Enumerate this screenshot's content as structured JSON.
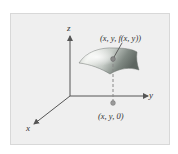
{
  "figure": {
    "axes": {
      "x_label": "x",
      "y_label": "y",
      "z_label": "z"
    },
    "surface_point_label": "(x, y, f(x, y))",
    "ground_point_label": "(x, y, 0)",
    "colors": {
      "panel_background": "#efefef",
      "axis_color": "#555555",
      "surface_light": "#e8ebe6",
      "surface_dark": "#6f7772",
      "point_color": "#8a8a8a"
    }
  }
}
